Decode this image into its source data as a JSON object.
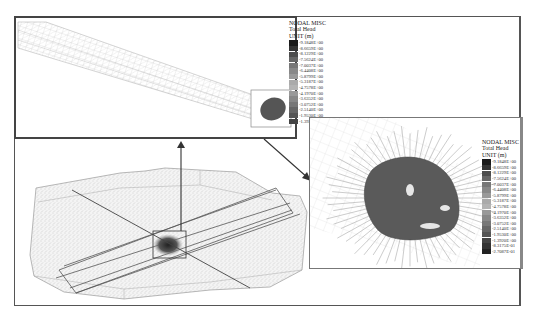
{
  "figure": {
    "panels": {
      "top_inset": {
        "label": "Tunnel mesh segment with total head contour",
        "legend": {
          "line1": "NODAL MISC",
          "line2": "Total Head",
          "line3": "UNIT (m)",
          "values": [
            "-9.1848E+00",
            "-8.6659E+00",
            "-8.1229E+00",
            "-7.5624E+00",
            "-7.0037E+00",
            "-6.4408E+00",
            "-5.8799E+00",
            "-5.3187E+00",
            "-4.7578E+00",
            "-4.1970E+00",
            "-3.6352E+00",
            "-3.0752E+00",
            "-2.5140E+00",
            "-1.9530E+00",
            "-1.3920E+00"
          ]
        }
      },
      "right_inset": {
        "label": "Close-up of grouting zone with flow vectors",
        "legend": {
          "line1": "NODAL MISC",
          "line2": "Total Head",
          "line3": "UNIT (m)",
          "values": [
            "-9.1848E+00",
            "-8.6659E+00",
            "-8.1229E+00",
            "-7.5624E+00",
            "-7.0037E+00",
            "-6.4408E+00",
            "-5.8799E+00",
            "-5.3187E+00",
            "-4.7578E+00",
            "-4.1970E+00",
            "-3.6352E+00",
            "-3.0752E+00",
            "-2.5140E+00",
            "-1.9530E+00",
            "-1.3920E+00",
            "-8.3175E-01",
            "-2.7087E-01"
          ]
        }
      },
      "main_view": {
        "label": "3D finite element mesh of rock mass with tunnel"
      }
    },
    "colors": {
      "frame": "#444444",
      "mesh": "#999999",
      "contour_dark": "#3a3a3a",
      "arrow": "#333333"
    },
    "legend_swatches": [
      "#1a1a1a",
      "#333333",
      "#4d4d4d",
      "#666666",
      "#777777",
      "#888888",
      "#999999",
      "#aaaaaa",
      "#b3b3b3",
      "#999999",
      "#888888",
      "#777777",
      "#666666",
      "#555555",
      "#444444",
      "#333333",
      "#222222"
    ]
  }
}
